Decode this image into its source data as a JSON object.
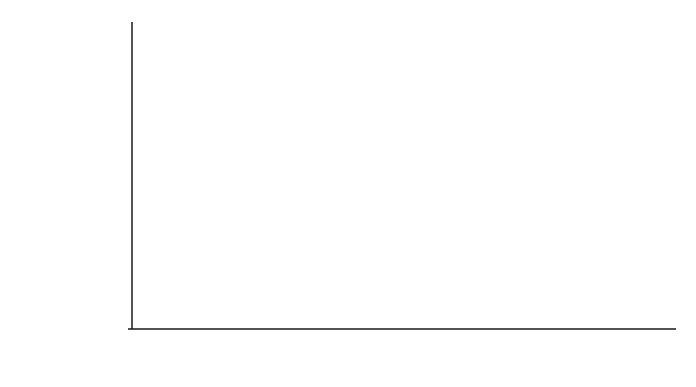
{
  "chart_data": {
    "type": "line",
    "title": "",
    "xlabel": "t",
    "ylabel": "Prob.",
    "xlim": [
      0,
      4
    ],
    "ylim": [
      0,
      0.17
    ],
    "grid": false,
    "legend": null,
    "x_ticks": [
      "0",
      "1",
      "2",
      "3",
      "4"
    ],
    "y_ticks": [
      "0",
      "0.02",
      "0.04",
      "0.06",
      "0.08",
      "0.10",
      "0.12",
      "0.14",
      "0.16"
    ],
    "series": [
      {
        "name": "Prob.",
        "color": "#2a2a2a",
        "x": [
          0,
          0.05,
          0.1,
          0.15,
          0.2,
          0.25,
          0.3,
          0.4,
          0.5,
          0.6,
          0.7,
          0.8,
          0.9,
          1.0,
          1.2,
          1.4,
          1.6,
          1.8,
          2.0,
          2.25,
          2.5,
          2.75,
          3.0,
          3.25,
          3.5,
          3.75,
          4.0
        ],
        "y": [
          0,
          0.001,
          0.005,
          0.012,
          0.021,
          0.031,
          0.042,
          0.062,
          0.079,
          0.093,
          0.104,
          0.113,
          0.12,
          0.126,
          0.135,
          0.142,
          0.147,
          0.151,
          0.154,
          0.157,
          0.16,
          0.162,
          0.164,
          0.1655,
          0.1665,
          0.1672,
          0.1678
        ]
      }
    ]
  },
  "axes": {
    "ylabel": "Prob.",
    "xlabel": "t"
  }
}
